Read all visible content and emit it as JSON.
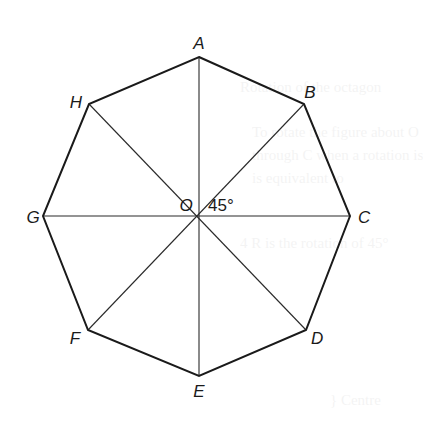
{
  "figure": {
    "type": "regular-octagon-construction",
    "center": {
      "label": "O",
      "x": 199,
      "y": 216
    },
    "angle_label": "45°",
    "vertices": [
      {
        "label": "A",
        "x": 199,
        "y": 57,
        "lx": 199,
        "ly": 49,
        "anchor": "middle"
      },
      {
        "label": "B",
        "x": 304,
        "y": 104,
        "lx": 310,
        "ly": 98,
        "anchor": "middle"
      },
      {
        "label": "C",
        "x": 350,
        "y": 216,
        "lx": 358,
        "ly": 223,
        "anchor": "start"
      },
      {
        "label": "D",
        "x": 306,
        "y": 330,
        "lx": 311,
        "ly": 344,
        "anchor": "start"
      },
      {
        "label": "E",
        "x": 199,
        "y": 376,
        "lx": 199,
        "ly": 397,
        "anchor": "middle"
      },
      {
        "label": "F",
        "x": 88,
        "y": 330,
        "lx": 75,
        "ly": 344,
        "anchor": "middle"
      },
      {
        "label": "G",
        "x": 43,
        "y": 216,
        "lx": 33,
        "ly": 223,
        "anchor": "middle"
      },
      {
        "label": "H",
        "x": 89,
        "y": 104,
        "lx": 76,
        "ly": 108,
        "anchor": "middle"
      }
    ],
    "colors": {
      "edge": "#1a1a1a",
      "radius": "#2a2a2a",
      "text": "#1a1a1a",
      "background": "#ffffff"
    }
  },
  "show_through": {
    "lines": [
      {
        "text": "Rotation of the octagon",
        "x": 240,
        "y": 92
      },
      {
        "text": "To rotate the figure about O",
        "x": 252,
        "y": 137
      },
      {
        "text": "through C when a rotation is",
        "x": 252,
        "y": 160
      },
      {
        "text": "is equivalent to",
        "x": 252,
        "y": 183
      },
      {
        "text": "4  R is the rotation of 45°",
        "x": 240,
        "y": 248
      },
      {
        "text": "} Centre",
        "x": 330,
        "y": 405
      }
    ]
  }
}
